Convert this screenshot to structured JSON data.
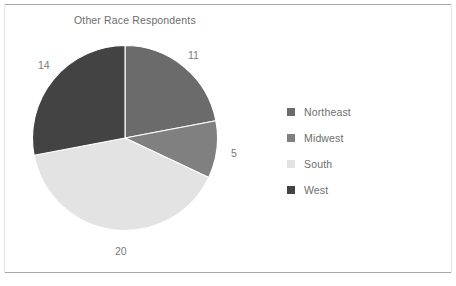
{
  "figure": {
    "background_color": "#ffffff",
    "frame_color": "#a8a8a8"
  },
  "chart_data": {
    "type": "pie",
    "title": "Other Race Respondents",
    "xlabel": "",
    "ylabel": "",
    "categories": [
      "Northeast",
      "Midwest",
      "South",
      "West"
    ],
    "values": [
      11,
      5,
      20,
      14
    ],
    "total": 50,
    "colors": [
      "#6b6b6b",
      "#808080",
      "#e3e3e3",
      "#434343"
    ],
    "data_labels": [
      "11",
      "5",
      "20",
      "14"
    ],
    "start_angle_deg": 0,
    "direction": "clockwise",
    "legend": {
      "position": "right",
      "entries": [
        {
          "label": "Northeast",
          "color": "#6b6b6b",
          "value": 11
        },
        {
          "label": "Midwest",
          "color": "#808080",
          "value": 5
        },
        {
          "label": "South",
          "color": "#e3e3e3",
          "value": 20
        },
        {
          "label": "West",
          "color": "#434343",
          "value": 14
        }
      ]
    },
    "grid": false
  },
  "labels": {
    "northeast": "11",
    "midwest": "5",
    "south": "20",
    "west": "14"
  }
}
